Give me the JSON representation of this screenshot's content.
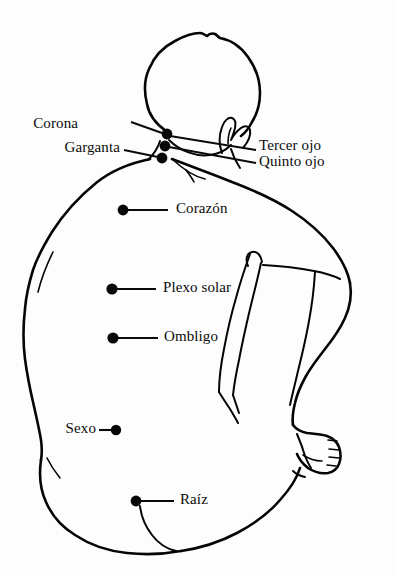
{
  "diagram": {
    "background_color": "#fdfdfd",
    "ink_color": "#080808",
    "width": 397,
    "height": 574,
    "labels": [
      {
        "id": "corona",
        "text": "Corona",
        "side": "left",
        "text_x": 78,
        "text_y": 116,
        "leader": {
          "x1": 131,
          "y1": 122,
          "x2": 162,
          "y2": 133
        },
        "dot": {
          "cx": 167,
          "cy": 134,
          "r": 5.4
        }
      },
      {
        "id": "garganta",
        "text": "Garganta",
        "side": "left",
        "text_x": 53,
        "text_y": 140,
        "leader": {
          "x1": 124,
          "y1": 150,
          "x2": 158,
          "y2": 157
        },
        "dot": {
          "cx": 162,
          "cy": 158,
          "r": 5.4
        }
      },
      {
        "id": "tercer-ojo",
        "text": "Tercer ojo",
        "side": "right",
        "text_x": 259,
        "text_y": 138,
        "leader": {
          "x1": 170,
          "y1": 136,
          "x2": 256,
          "y2": 150
        },
        "dot": {
          "cx": 167,
          "cy": 134,
          "r": 5.4
        }
      },
      {
        "id": "quinto-ojo",
        "text": "Quinto ojo",
        "side": "right",
        "text_x": 259,
        "text_y": 154,
        "leader": {
          "x1": 169,
          "y1": 147,
          "x2": 256,
          "y2": 163
        },
        "dot": {
          "cx": 165,
          "cy": 146,
          "r": 5.4
        }
      },
      {
        "id": "corazon",
        "text": "Corazón",
        "side": "right",
        "text_x": 176,
        "text_y": 202,
        "leader": {
          "x1": 126,
          "y1": 210,
          "x2": 168,
          "y2": 210
        },
        "dot": {
          "cx": 123,
          "cy": 210,
          "r": 5.4
        }
      },
      {
        "id": "plexo-solar",
        "text": "Plexo solar",
        "side": "right",
        "text_x": 163,
        "text_y": 281,
        "leader": {
          "x1": 115,
          "y1": 289,
          "x2": 156,
          "y2": 289
        },
        "dot": {
          "cx": 112,
          "cy": 289,
          "r": 5.6
        }
      },
      {
        "id": "ombligo",
        "text": "Ombligo",
        "side": "right",
        "text_x": 164,
        "text_y": 330,
        "leader": {
          "x1": 116,
          "y1": 338,
          "x2": 158,
          "y2": 338
        },
        "dot": {
          "cx": 113,
          "cy": 338,
          "r": 5.6
        }
      },
      {
        "id": "sexo",
        "text": "Sexo",
        "side": "left",
        "text_x": 66,
        "text_y": 422,
        "leader": {
          "x1": 99,
          "y1": 430,
          "x2": 113,
          "y2": 430
        },
        "dot": {
          "cx": 116,
          "cy": 430,
          "r": 5.2
        }
      },
      {
        "id": "raiz",
        "text": "Raíz",
        "side": "right",
        "text_x": 180,
        "text_y": 493,
        "leader": {
          "x1": 139,
          "y1": 501,
          "x2": 174,
          "y2": 501
        },
        "dot": {
          "cx": 136,
          "cy": 501,
          "r": 5.4
        }
      }
    ]
  }
}
